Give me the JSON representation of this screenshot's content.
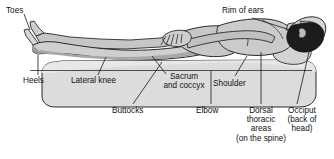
{
  "figure": {
    "background_color": "#ffffff",
    "line_color": "#1a1a1a",
    "skin_light": "#d8d8d8",
    "skin_mid": "#b8b8b8",
    "skin_shadow": "#9a9a9a",
    "hair_color": "#1c1c1c",
    "mattress_fill": "#dcdcdc",
    "mattress_top": "#e6e6e6"
  },
  "labels": {
    "toes": "Toes",
    "heels": "Heels",
    "lateral_knee": "Lateral knee",
    "buttocks": "Buttocks",
    "sacrum_and_coccyx": "Sacrum\nand coccyx",
    "shoulder": "Shoulder",
    "elbow": "Elbow",
    "rim_of_ears": "Rim of ears",
    "dorsal_thoracic": "Dorsal\nthoracic\nareas\n(on the spine)",
    "occiput": "Occiput\n(back of\nhead)"
  }
}
